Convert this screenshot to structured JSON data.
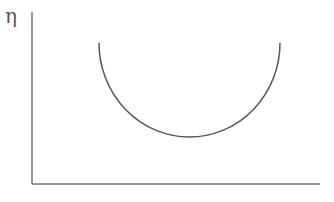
{
  "diagram": {
    "y_axis_label": "η",
    "x_axis_label": "",
    "curve": {
      "shape": "semicircle (U-shaped curve)",
      "start": [
        99,
        43
      ],
      "end": [
        280,
        43
      ],
      "minimum": [
        189,
        137
      ]
    },
    "colors": {
      "axis": "#777777",
      "curve": "#555555",
      "label": "#555555"
    }
  }
}
